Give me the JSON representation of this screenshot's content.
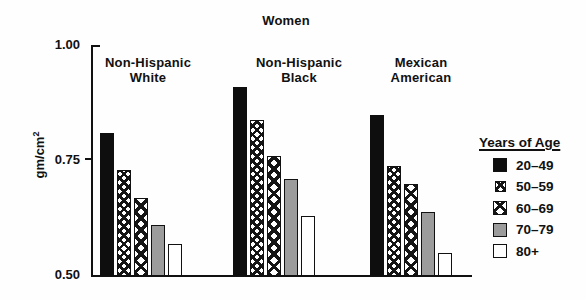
{
  "chart_data": {
    "type": "bar",
    "title": "Women",
    "ylabel_base": "gm/cm",
    "ylabel_exponent": "2",
    "ylim": [
      0.5,
      1.0
    ],
    "grid": false,
    "legend_position": "right",
    "legend_title": "Years of Age",
    "y_ticks": [
      {
        "label": "1.00",
        "value": 1.0
      },
      {
        "label": "0.75",
        "value": 0.75
      },
      {
        "label": "0.50",
        "value": 0.5
      }
    ],
    "categories": [
      "Non-Hispanic White",
      "Non-Hispanic Black",
      "Mexican American"
    ],
    "category_labels": [
      "Non-Hispanic\nWhite",
      "Non-Hispanic\nBlack",
      "Mexican\nAmerican"
    ],
    "series": [
      {
        "name": "20–49",
        "pattern": "solid-black",
        "values": [
          0.81,
          0.91,
          0.85
        ]
      },
      {
        "name": "50–59",
        "pattern": "fine-crosshatch",
        "values": [
          0.73,
          0.84,
          0.74
        ]
      },
      {
        "name": "60–69",
        "pattern": "coarse-crosshatch",
        "values": [
          0.67,
          0.76,
          0.7
        ]
      },
      {
        "name": "70–79",
        "pattern": "solid-gray",
        "values": [
          0.61,
          0.71,
          0.64
        ]
      },
      {
        "name": "80+",
        "pattern": "white",
        "values": [
          0.57,
          0.63,
          0.55
        ]
      }
    ],
    "colors": {
      "bar_black": "#0e0e0e",
      "bar_gray": "#9c9c9c",
      "bar_white": "#ffffff",
      "outline": "#111111"
    }
  }
}
